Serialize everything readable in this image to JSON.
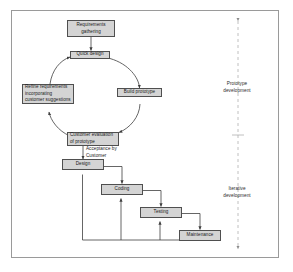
{
  "diagram": {
    "frame": {
      "border_color": "#9a9a9a",
      "background": "#ffffff"
    },
    "style": {
      "node_fill": "#d4d4d4",
      "node_border": "#4f4f4f",
      "connector_color": "#3f3f3f",
      "divider_color": "#b0b0b0",
      "text_color": "#1a1a1a"
    },
    "nodes": [
      {
        "id": "requirements",
        "label": "Requirements\ngathering"
      },
      {
        "id": "quick_design",
        "label": "Quick design"
      },
      {
        "id": "build_prototype",
        "label": "Build prototype"
      },
      {
        "id": "customer_evaluation",
        "label": "Customer evaluation\nof prototype"
      },
      {
        "id": "refine_requirements",
        "label": "Refine requirements\nincorporating\ncustomer suggestions"
      },
      {
        "id": "design",
        "label": "Design"
      },
      {
        "id": "coding",
        "label": "Coding"
      },
      {
        "id": "testing",
        "label": "Testing"
      },
      {
        "id": "maintenance",
        "label": "Maintenance"
      }
    ],
    "edge_labels": [
      {
        "id": "acceptance",
        "label": "Acceptance by\nCustomer"
      }
    ],
    "phase_labels": [
      {
        "id": "prototype_development",
        "label": "Prototype\ndevelopment"
      },
      {
        "id": "iterative_development",
        "label": "Iterative\ndevelopment"
      }
    ],
    "divider": {
      "id": "phase-divider",
      "orientation": "vertical",
      "style": "dashed",
      "arrow_top": true,
      "arrow_bottom": true,
      "midpoint_marker": "cross"
    }
  }
}
